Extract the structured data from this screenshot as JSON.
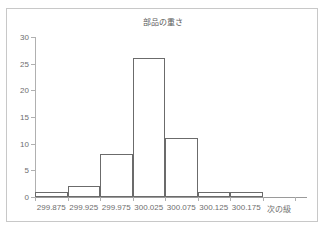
{
  "chart_data": {
    "type": "bar",
    "title": "部品の重さ",
    "xlabel": "",
    "ylabel": "",
    "categories": [
      "299.875",
      "299.925",
      "299.975",
      "300.025",
      "300.075",
      "300.125",
      "300.175",
      "次の級"
    ],
    "values": [
      1,
      2,
      8,
      26,
      11,
      1,
      1,
      0
    ],
    "ylim": [
      0,
      30
    ],
    "y_ticks": [
      0,
      5,
      10,
      15,
      20,
      25,
      30
    ],
    "y_tick_labels": [
      "0",
      "5",
      "10",
      "15",
      "20",
      "25",
      "30"
    ],
    "grid": false,
    "legend": false,
    "legend_position": "none",
    "bar_style": "histogram-outline",
    "colors": {
      "bar_border": "#6b6b6b",
      "bar_fill": "#ffffff",
      "axis": "#b0b0b0",
      "text": "#6e6e6e",
      "title_text": "#5a5a5a",
      "frame_border": "#c8c8c8",
      "background": "#ffffff"
    }
  }
}
